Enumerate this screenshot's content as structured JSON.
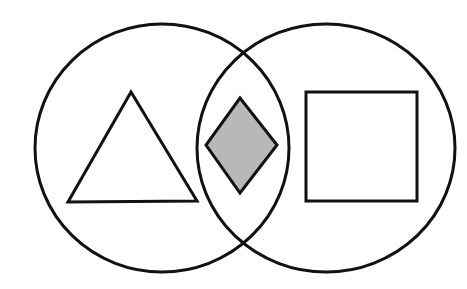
{
  "diagram": {
    "type": "venn",
    "background": "#ffffff",
    "stroke_color": "#111111",
    "stroke_width": 3,
    "sets": [
      {
        "id": "left",
        "shape": "circle",
        "cx": 162,
        "cy": 148,
        "rx": 127,
        "ry": 124,
        "contains": "triangle"
      },
      {
        "id": "right",
        "shape": "circle",
        "cx": 326,
        "cy": 148,
        "rx": 129,
        "ry": 124,
        "contains": "square"
      }
    ],
    "elements": {
      "triangle": {
        "region": "left-only",
        "points": "131,92 68,202 197,201",
        "fill": "#ffffff"
      },
      "diamond": {
        "region": "intersection",
        "points": "240,98 277,145 240,193 206,145",
        "fill": "#b8b8b8"
      },
      "square": {
        "region": "right-only",
        "x": 306,
        "y": 92,
        "width": 111,
        "height": 109,
        "fill": "#ffffff"
      }
    }
  }
}
